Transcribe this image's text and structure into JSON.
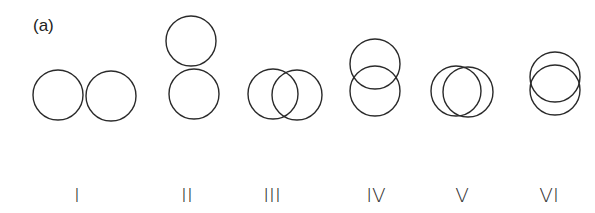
{
  "panel_label": "(a)",
  "figure": {
    "stroke_color": "#2a2a2a",
    "configurations": [
      {
        "label": "I",
        "label_x": 77,
        "circles": [
          {
            "cx": 58,
            "cy": 95,
            "r": 25
          },
          {
            "cx": 111,
            "cy": 96,
            "r": 25
          }
        ]
      },
      {
        "label": "II",
        "label_x": 187,
        "circles": [
          {
            "cx": 191,
            "cy": 41,
            "r": 25
          },
          {
            "cx": 194,
            "cy": 94,
            "r": 25
          }
        ]
      },
      {
        "label": "III",
        "label_x": 272,
        "circles": [
          {
            "cx": 273,
            "cy": 94,
            "r": 25
          },
          {
            "cx": 297,
            "cy": 95,
            "r": 25
          }
        ]
      },
      {
        "label": "IV",
        "label_x": 376,
        "circles": [
          {
            "cx": 375,
            "cy": 64,
            "r": 25
          },
          {
            "cx": 375,
            "cy": 91,
            "r": 25
          }
        ]
      },
      {
        "label": "V",
        "label_x": 462,
        "circles": [
          {
            "cx": 456,
            "cy": 91,
            "r": 25
          },
          {
            "cx": 468,
            "cy": 92,
            "r": 25
          }
        ]
      },
      {
        "label": "VI",
        "label_x": 549,
        "circles": [
          {
            "cx": 555,
            "cy": 77,
            "r": 25
          },
          {
            "cx": 555,
            "cy": 90,
            "r": 25
          }
        ]
      }
    ]
  }
}
